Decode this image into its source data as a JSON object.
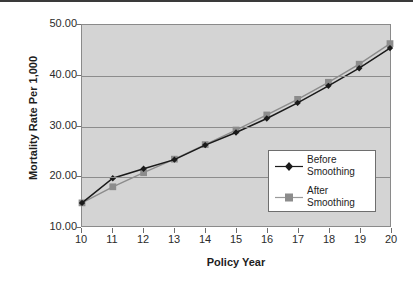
{
  "chart_data": {
    "type": "line",
    "title": "",
    "xlabel": "Policy Year",
    "ylabel": "Mortality Rate Per 1,000",
    "xlim": [
      10,
      20
    ],
    "ylim": [
      10.0,
      50.0
    ],
    "y_ticks": [
      "10.00",
      "20.00",
      "30.00",
      "40.00",
      "50.00"
    ],
    "y_tick_values": [
      10,
      20,
      30,
      40,
      50
    ],
    "x_ticks": [
      "10",
      "11",
      "12",
      "13",
      "14",
      "15",
      "16",
      "17",
      "18",
      "19",
      "20"
    ],
    "categories": [
      10,
      11,
      12,
      13,
      14,
      15,
      16,
      17,
      18,
      19,
      20
    ],
    "grid": "horizontal",
    "legend_position": "inside-bottom-right",
    "plot_background": "#d4d4d4",
    "series": [
      {
        "name": "Before Smoothing",
        "legend_label_line1": "Before",
        "legend_label_line2": "Smoothing",
        "color": "#1a1a1a",
        "marker": "diamond",
        "values": [
          14.6,
          19.5,
          21.4,
          23.2,
          26.1,
          28.6,
          31.4,
          34.5,
          37.9,
          41.4,
          45.4
        ]
      },
      {
        "name": "After Smoothing",
        "legend_label_line1": "After",
        "legend_label_line2": "Smoothing",
        "color": "#8c8c8c",
        "marker": "square",
        "values": [
          14.6,
          17.8,
          20.6,
          23.3,
          26.2,
          29.1,
          32.1,
          35.2,
          38.6,
          42.2,
          46.3
        ]
      }
    ]
  },
  "axis": {
    "x_title": "Policy Year",
    "y_title": "Mortality Rate Per 1,000"
  }
}
